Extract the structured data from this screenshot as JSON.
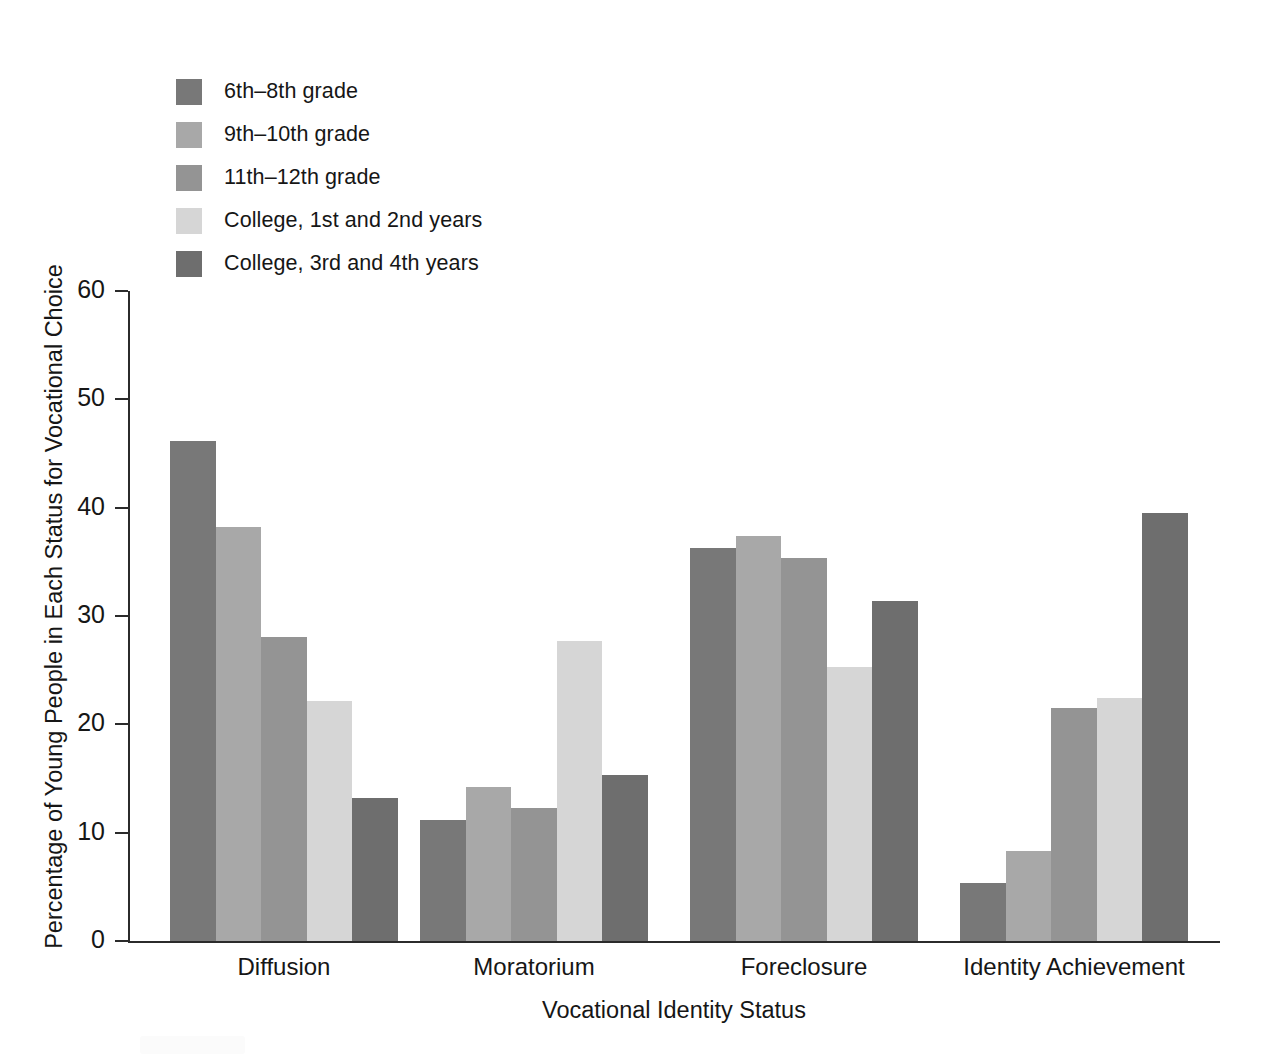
{
  "chart_data": {
    "type": "bar",
    "title": "",
    "xlabel": "Vocational Identity Status",
    "ylabel": "Percentage of Young People in Each Status for Vocational Choice",
    "categories": [
      "Diffusion",
      "Moratorium",
      "Foreclosure",
      "Identity Achievement"
    ],
    "ylim": [
      0,
      60
    ],
    "yticks": [
      0,
      10,
      20,
      30,
      40,
      50,
      60
    ],
    "ytick_labels": [
      "0",
      "10",
      "20",
      "30",
      "40",
      "50",
      "60"
    ],
    "grid": false,
    "legend_position": "top-left",
    "series": [
      {
        "name": "6th–8th grade",
        "color": "#787878",
        "values": [
          46.2,
          11.2,
          36.3,
          5.4
        ]
      },
      {
        "name": "9th–10th grade",
        "color": "#a8a8a8",
        "values": [
          38.2,
          14.2,
          37.4,
          8.3
        ]
      },
      {
        "name": "11th–12th grade",
        "color": "#949494",
        "values": [
          28.1,
          12.3,
          35.4,
          21.5
        ]
      },
      {
        "name": "College, 1st and 2nd years",
        "color": "#d6d6d6",
        "values": [
          22.2,
          27.7,
          25.3,
          22.4
        ]
      },
      {
        "name": "College, 3rd and 4th years",
        "color": "#6e6e6e",
        "values": [
          13.2,
          15.3,
          31.4,
          39.5
        ]
      }
    ]
  }
}
